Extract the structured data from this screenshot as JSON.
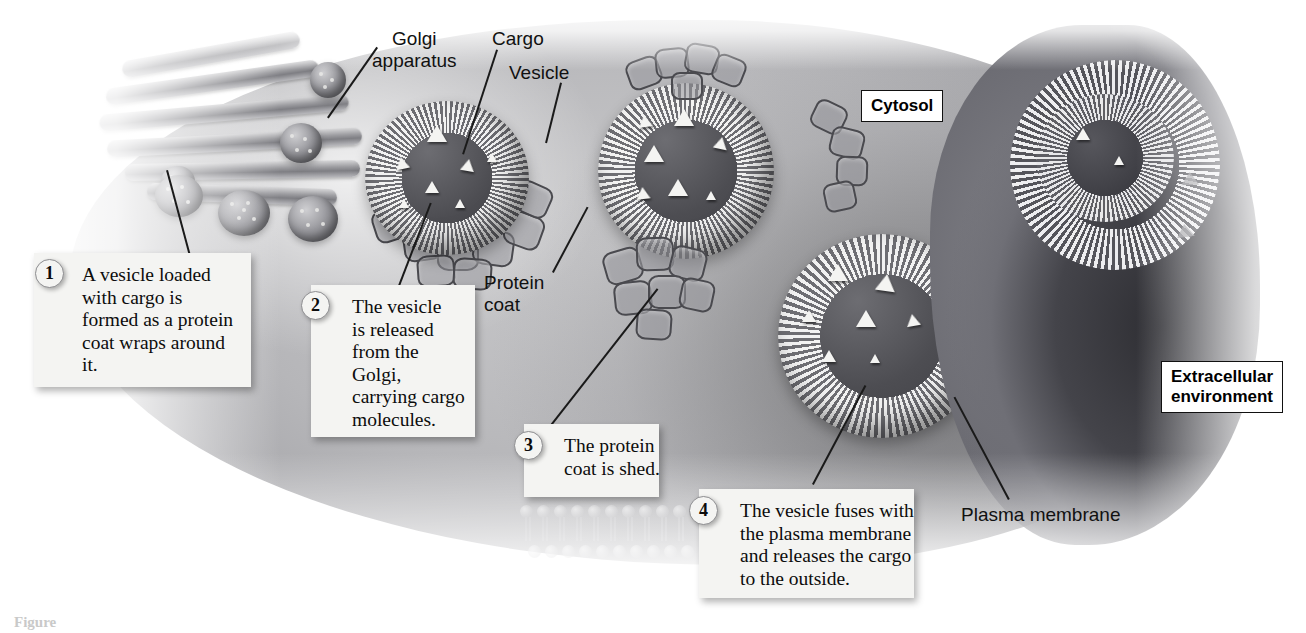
{
  "figure": {
    "type": "biology-diagram",
    "caption": "Figure"
  },
  "region_labels": [
    {
      "id": "cytosol",
      "text": "Cytosol"
    },
    {
      "id": "extracellular",
      "text": "Extracellular\nenvironment"
    }
  ],
  "part_labels": [
    {
      "id": "golgi-apparatus",
      "text": "Golgi\napparatus"
    },
    {
      "id": "cargo",
      "text": "Cargo"
    },
    {
      "id": "vesicle",
      "text": "Vesicle"
    },
    {
      "id": "protein-coat",
      "text": "Protein\ncoat"
    },
    {
      "id": "plasma-membrane",
      "text": "Plasma membrane"
    }
  ],
  "steps": [
    {
      "number": "1",
      "text": "A vesicle loaded\nwith cargo is\nformed as a protein\ncoat wraps around\nit."
    },
    {
      "number": "2",
      "text": "The vesicle\nis released\nfrom the\nGolgi,\ncarrying cargo\nmolecules."
    },
    {
      "number": "3",
      "text": "The protein\ncoat is shed."
    },
    {
      "number": "4",
      "text": "The vesicle fuses with\nthe plasma membrane\nand releases the cargo\nto the outside."
    }
  ],
  "colors": {
    "background": "#ffffff",
    "cytoplasm": "#b6b6b9",
    "membrane_dark": "#3c3c41",
    "cargo": "#f4f4f2",
    "callout_bg": "#f4f4f2",
    "text": "#0c0c0c"
  }
}
